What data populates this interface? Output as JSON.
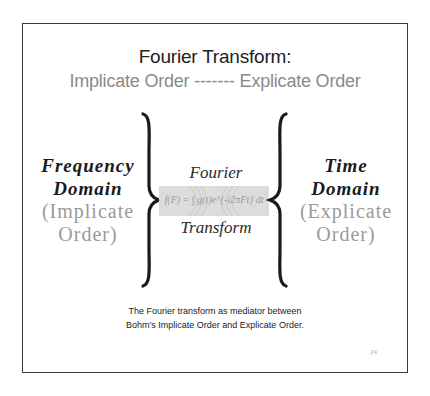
{
  "slide": {
    "title_line1": "Fourier Transform:",
    "title_line2": "Implicate Order ------- Explicate Order",
    "left": {
      "heading_line1": "Frequency",
      "heading_line2": "Domain",
      "sub_line1": "(Implicate",
      "sub_line2": "Order)"
    },
    "right": {
      "heading_line1": "Time",
      "heading_line2": "Domain",
      "sub_line1": "(Explicate",
      "sub_line2": "Order)"
    },
    "center": {
      "word_top": "Fourier",
      "word_bottom": "Transform",
      "formula": "f(F) = ∫ g(t)e^{-i2πFt} dt"
    },
    "caption_line1": "The Fourier transform as mediator between",
    "caption_line2": "Bohm's Implicate Order and Explicate Order.",
    "page_number": "24"
  },
  "colors": {
    "border": "#3a3a3a",
    "title_dark": "#222222",
    "title_gray": "#8a8a8a",
    "heading": "#1a1a1a",
    "sub_gray": "#9a9a9a",
    "formula_band": "#dcdcdc"
  }
}
